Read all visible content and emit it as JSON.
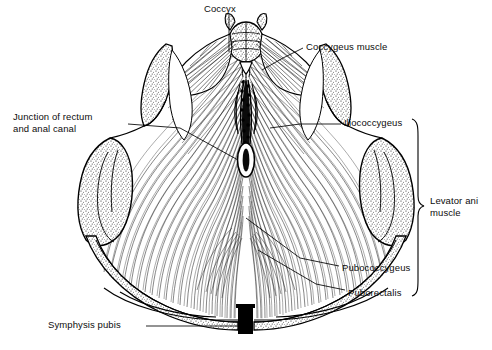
{
  "figure": {
    "view": "superior",
    "style": "black-and-white line drawing with hatched muscle fibers and stippled bone",
    "background_color": "#ffffff",
    "ink_color": "#000000"
  },
  "labels": [
    {
      "name": "coccyx",
      "text": "Coccyx",
      "x": 204,
      "y": 4,
      "lines": 1,
      "leader": "vertical-down-to-midline-coccyx"
    },
    {
      "name": "coccygeus-muscle",
      "text": "Coccygeus muscle",
      "x": 306,
      "y": 42,
      "lines": 1,
      "leader": "left-down-to-right-coccygeus"
    },
    {
      "name": "junction-of-rectum-and-anal-canal",
      "text": "Junction of rectum\nand anal canal",
      "x": 13,
      "y": 112,
      "lines": 2,
      "leader": "right-down-to-anal-canal"
    },
    {
      "name": "iliococcygeus",
      "text": "Iliococcygeus",
      "x": 344,
      "y": 118,
      "lines": 1,
      "leader": "left-to-right-iliococcygeus"
    },
    {
      "name": "levator-ani-muscle",
      "text": "Levator ani\nmuscle",
      "x": 430,
      "y": 196,
      "lines": 2,
      "leader": "curly-brace-group"
    },
    {
      "name": "pubococcygeus",
      "text": "Pubococcygeus",
      "x": 342,
      "y": 263,
      "lines": 1,
      "leader": "left-up-to-pubococcygeus"
    },
    {
      "name": "puborectalis",
      "text": "Puborectalis",
      "x": 348,
      "y": 288,
      "lines": 1,
      "leader": "left-up-to-puborectalis"
    },
    {
      "name": "symphysis-pubis",
      "text": "Symphysis pubis",
      "x": 48,
      "y": 320,
      "lines": 1,
      "leader": "right-to-symphysis-block"
    }
  ],
  "brace": {
    "name": "levator-ani-brace",
    "groups": [
      "Iliococcygeus",
      "Pubococcygeus",
      "Puborectalis"
    ],
    "x": 418,
    "y_top": 118,
    "y_bottom": 296
  },
  "structures": [
    {
      "name": "coccyx-bone",
      "render": "stippled segmented bone at top midline"
    },
    {
      "name": "anococcygeal-raphe",
      "render": "dark vertical midline raphe"
    },
    {
      "name": "anal-canal-opening",
      "render": "white vertical oval at center"
    },
    {
      "name": "left-coccygeus-muscle",
      "render": "fan of radiating fibers, upper left"
    },
    {
      "name": "right-coccygeus-muscle",
      "render": "fan of radiating fibers, upper right"
    },
    {
      "name": "left-ischial-spine",
      "render": "stippled bone spur, upper left"
    },
    {
      "name": "right-ischial-spine",
      "render": "stippled bone spur, upper right"
    },
    {
      "name": "left-ischial-tuberosity",
      "render": "stippled rounded bone, mid left"
    },
    {
      "name": "right-ischial-tuberosity",
      "render": "stippled rounded bone, mid right"
    },
    {
      "name": "left-pubic-ramus",
      "render": "thin stippled bone arch descending to midline"
    },
    {
      "name": "right-pubic-ramus",
      "render": "thin stippled bone arch descending to midline"
    },
    {
      "name": "symphysis-pubis-block",
      "render": "solid black rectangle at bottom midline"
    },
    {
      "name": "levator-plate",
      "render": "broad sheet of curved hatched fibers filling pelvic outlet"
    }
  ]
}
